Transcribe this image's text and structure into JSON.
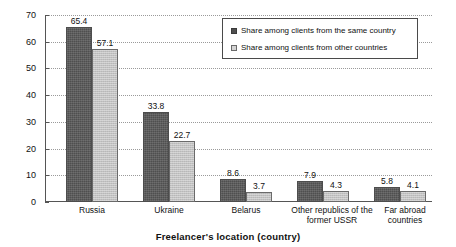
{
  "chart_data": {
    "type": "bar",
    "title": "",
    "xlabel": "Freelancer's location (country)",
    "ylabel": "",
    "ylim": [
      0,
      70
    ],
    "yticks": [
      0,
      10,
      20,
      30,
      40,
      50,
      60,
      70
    ],
    "grid": true,
    "legend_position": "top-right",
    "categories": [
      "Russia",
      "Ukraine",
      "Belarus",
      "Other republics of the former USSR",
      "Far abroad countries"
    ],
    "category_lines": [
      [
        "Russia"
      ],
      [
        "Ukraine"
      ],
      [
        "Belarus"
      ],
      [
        "Other republics of the",
        "former USSR"
      ],
      [
        "Far abroad countries"
      ]
    ],
    "series": [
      {
        "name": "Share among clients from the same country",
        "color": "#4f4f4f",
        "values": [
          65.4,
          33.8,
          8.6,
          7.9,
          5.8
        ],
        "labels": [
          "65.4",
          "33.8",
          "8.6",
          "7.9",
          "5.8"
        ]
      },
      {
        "name": "Share among clients from other countries",
        "color": "#c2c2c2",
        "values": [
          57.1,
          22.7,
          3.7,
          4.3,
          4.1
        ],
        "labels": [
          "57.1",
          "22.7",
          "3.7",
          "4.3",
          "4.1"
        ]
      }
    ]
  },
  "axis": {
    "y_tick_labels": [
      "70",
      "60",
      "50",
      "40",
      "30",
      "20",
      "10",
      "0"
    ],
    "x_axis_title": "Freelancer's location (country)"
  },
  "legend": {
    "items": [
      {
        "label": "Share among clients from the same country",
        "swatch": "dark-gray"
      },
      {
        "label": "Share among clients from other countries",
        "swatch": "light-gray"
      }
    ]
  }
}
